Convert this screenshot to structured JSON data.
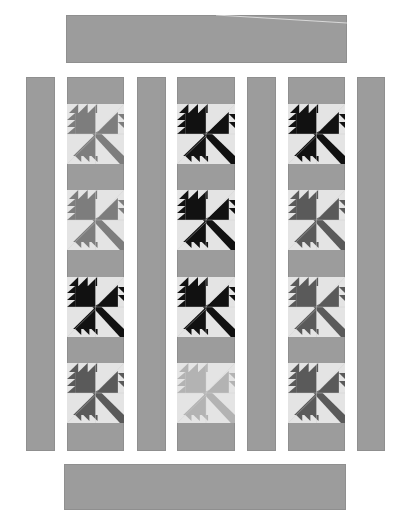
{
  "quilt": {
    "title": "Maple leaf quilt layout",
    "colors": {
      "sashing": "#9c9c9c",
      "background": "#e4e4e4",
      "black": "#111111",
      "dark": "#5a5a5a",
      "medium": "#7d7d7d",
      "light": "#b3b3b3"
    },
    "top_border": {
      "x": 66,
      "y": 15,
      "w": 281,
      "h": 48
    },
    "bottom_border": {
      "x": 64,
      "y": 464,
      "w": 282,
      "h": 46
    },
    "side_strips": [
      {
        "x": 26,
        "y": 77,
        "w": 29,
        "h": 374
      },
      {
        "x": 137,
        "y": 77,
        "w": 29,
        "h": 374
      },
      {
        "x": 247,
        "y": 77,
        "w": 29,
        "h": 374
      },
      {
        "x": 357,
        "y": 77,
        "w": 28,
        "h": 374
      }
    ],
    "columns": [
      {
        "x": 67,
        "y": 77,
        "w": 57,
        "h": 374,
        "blocks": [
          {
            "y": 27,
            "shade": "medium"
          },
          {
            "y": 113,
            "shade": "medium"
          },
          {
            "y": 200,
            "shade": "black"
          },
          {
            "y": 286,
            "shade": "dark"
          }
        ]
      },
      {
        "x": 177,
        "y": 77,
        "w": 58,
        "h": 374,
        "blocks": [
          {
            "y": 27,
            "shade": "black"
          },
          {
            "y": 113,
            "shade": "black"
          },
          {
            "y": 200,
            "shade": "black"
          },
          {
            "y": 286,
            "shade": "light"
          }
        ]
      },
      {
        "x": 288,
        "y": 77,
        "w": 57,
        "h": 374,
        "blocks": [
          {
            "y": 27,
            "shade": "black"
          },
          {
            "y": 113,
            "shade": "dark"
          },
          {
            "y": 200,
            "shade": "dark"
          },
          {
            "y": 286,
            "shade": "dark"
          }
        ]
      }
    ]
  }
}
